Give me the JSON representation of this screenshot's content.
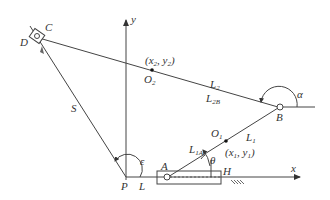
{
  "diagram": {
    "type": "mechanism-kinematic-schematic",
    "colors": {
      "line": "#444444",
      "text": "#333333",
      "background": "#ffffff"
    },
    "axes": {
      "x_label": "x",
      "y_label": "y"
    },
    "points": {
      "C": "C",
      "D": "D",
      "B": "B",
      "A": "A",
      "P": "P",
      "H": "H",
      "O1": {
        "main": "O",
        "sub": "1"
      },
      "O2": {
        "main": "O",
        "sub": "2"
      }
    },
    "coordinates": {
      "c1": {
        "open": "(x",
        "s1": "1",
        "mid": ", y",
        "s2": "1",
        "close": ")"
      },
      "c2": {
        "open": "(x",
        "s1": "2",
        "mid": ", y",
        "s2": "2",
        "close": ")"
      }
    },
    "links": {
      "S": "S",
      "L": "L",
      "L1": {
        "main": "L",
        "sub": "1"
      },
      "L1A": {
        "main": "L",
        "sub": "1A"
      },
      "L2": {
        "main": "L",
        "sub": "2"
      },
      "L2B": {
        "main": "L",
        "sub": "2B"
      }
    },
    "angles": {
      "alpha": "α",
      "theta": "θ",
      "epsilon": "ε"
    }
  }
}
